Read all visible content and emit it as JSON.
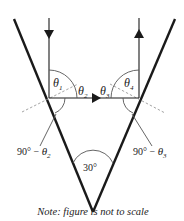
{
  "diagram": {
    "type": "ray-reflection-between-two-mirrors",
    "apex_angle_label": "30°",
    "angles": {
      "theta1": {
        "symbol": "θ",
        "sub": "1"
      },
      "theta2": {
        "symbol": "θ",
        "sub": "2"
      },
      "theta3": {
        "symbol": "θ",
        "sub": "3"
      },
      "theta4": {
        "symbol": "θ",
        "sub": "4"
      }
    },
    "left_label": {
      "prefix": "90° − ",
      "symbol": "θ",
      "sub": "2"
    },
    "right_label": {
      "prefix": "90° − ",
      "symbol": "θ",
      "sub": "3"
    },
    "note": "Note: figure is not to scale",
    "colors": {
      "line": "#1a1a1a",
      "dashed": "#9a9a9a"
    }
  }
}
